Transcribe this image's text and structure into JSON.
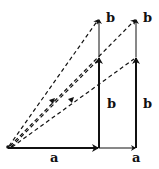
{
  "diagram": {
    "colors": {
      "stroke": "#111111",
      "background": "#ffffff"
    },
    "labels": {
      "a_bottom_left": "a",
      "a_bottom_right": "a",
      "b_mid_left": "b",
      "b_mid_right": "b",
      "b_top_left": "b",
      "b_top_right": "b"
    },
    "origin": [
      8,
      147
    ],
    "solid_vectors": [
      {
        "name": "a",
        "from": [
          8,
          148
        ],
        "to": [
          99,
          148
        ]
      },
      {
        "name": "a",
        "from": [
          99,
          148
        ],
        "to": [
          136,
          148
        ]
      },
      {
        "name": "b",
        "from": [
          99,
          148
        ],
        "to": [
          99,
          57
        ]
      },
      {
        "name": "b",
        "from": [
          136,
          148
        ],
        "to": [
          136,
          57
        ]
      },
      {
        "name": "b",
        "from": [
          99,
          57
        ],
        "to": [
          99,
          18
        ]
      },
      {
        "name": "b",
        "from": [
          136,
          57
        ],
        "to": [
          136,
          18
        ]
      }
    ],
    "dashed_vectors": [
      {
        "from": [
          8,
          147
        ],
        "to": [
          99,
          18
        ]
      },
      {
        "from": [
          8,
          147
        ],
        "to": [
          136,
          18
        ]
      },
      {
        "from": [
          8,
          147
        ],
        "to": [
          99,
          57
        ]
      },
      {
        "from": [
          8,
          147
        ],
        "to": [
          136,
          57
        ]
      }
    ]
  }
}
